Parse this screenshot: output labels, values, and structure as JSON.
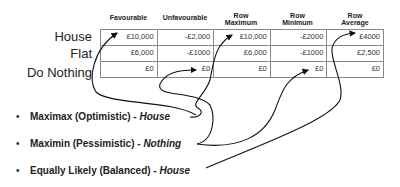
{
  "table": {
    "headers": [
      {
        "line1": "Favourable",
        "line2": ""
      },
      {
        "line1": "Unfavourable",
        "line2": ""
      },
      {
        "line1": "Row",
        "line2": "Maximum"
      },
      {
        "line1": "Row",
        "line2": "Minimum"
      },
      {
        "line1": "Row",
        "line2": "Average"
      }
    ],
    "row_labels": [
      "House",
      "Flat",
      "Do Nothing"
    ],
    "rows": [
      [
        "£10,000",
        "-£2,000",
        "£10,000",
        "-£2000",
        "£4000"
      ],
      [
        "£6,000",
        "-£1000",
        "£6,000",
        "-£1000",
        "£2,500"
      ],
      [
        "£0",
        "£0",
        "£0",
        "£0",
        "£0"
      ]
    ]
  },
  "criteria": [
    {
      "bullet": "•",
      "label": "Maximax (Optimistic) - ",
      "answer": "House"
    },
    {
      "bullet": "•",
      "label": "Maximin (Pessimistic) - ",
      "answer": "Nothing"
    },
    {
      "bullet": "•",
      "label": "Equally Likely (Balanced) - ",
      "answer": "House"
    }
  ],
  "colors": {
    "line": "#111111",
    "grid": "#8a8a8a",
    "text": "#222222"
  }
}
